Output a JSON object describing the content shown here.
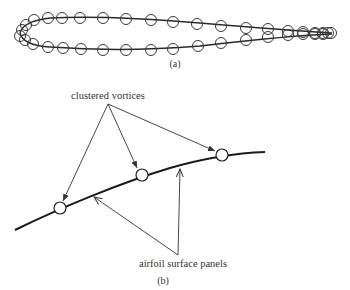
{
  "figure_a": {
    "caption": "(a)",
    "line_color": "#2a2a2a",
    "vortex_stroke": "#3a3a3a",
    "upper_surface_vortices": [
      [
        22,
        30
      ],
      [
        26,
        25
      ],
      [
        34,
        20
      ],
      [
        48,
        18
      ],
      [
        62,
        18
      ],
      [
        80,
        18
      ],
      [
        103,
        18
      ],
      [
        126,
        19
      ],
      [
        151,
        20
      ],
      [
        173,
        22
      ],
      [
        197,
        24
      ],
      [
        221,
        26
      ],
      [
        246,
        28
      ],
      [
        268,
        29
      ],
      [
        288,
        31
      ],
      [
        303,
        32
      ],
      [
        315,
        33
      ],
      [
        323,
        33
      ],
      [
        328,
        33
      ],
      [
        331,
        33
      ]
    ],
    "lower_surface_vortices": [
      [
        20,
        36
      ],
      [
        25,
        40
      ],
      [
        33,
        44
      ],
      [
        48,
        47
      ],
      [
        63,
        48
      ],
      [
        81,
        49
      ],
      [
        103,
        50
      ],
      [
        126,
        50
      ],
      [
        151,
        50
      ],
      [
        173,
        49
      ],
      [
        198,
        46
      ],
      [
        221,
        43
      ],
      [
        246,
        40
      ],
      [
        268,
        37
      ],
      [
        288,
        35
      ],
      [
        303,
        34
      ],
      [
        315,
        34
      ],
      [
        323,
        34
      ]
    ]
  },
  "figure_b": {
    "caption": "(b)",
    "label_vortices": "clustered vortices",
    "label_panels": "airfoil surface panels",
    "curve_color": "#1a1a1a",
    "vortices": [
      [
        60,
        208
      ],
      [
        142,
        175
      ],
      [
        222,
        155
      ]
    ],
    "vortex_arrow_origin": [
      108,
      104
    ],
    "panel_arrow_origin": [
      178,
      255
    ],
    "panel_arrow_targets": [
      [
        93,
        196
      ],
      [
        180,
        167
      ]
    ]
  }
}
